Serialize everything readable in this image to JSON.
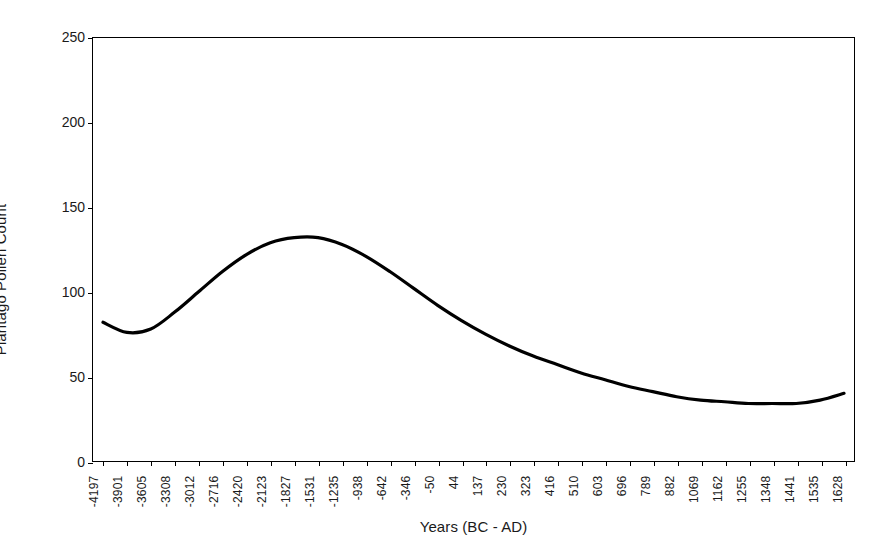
{
  "chart_data": {
    "type": "line",
    "title": "",
    "xlabel": "Years (BC - AD)",
    "ylabel": "Plantago Pollen Count",
    "ylim": [
      0,
      250
    ],
    "ytick_labels": [
      "0",
      "50",
      "100",
      "150",
      "200",
      "250"
    ],
    "ytick_values": [
      0,
      50,
      100,
      150,
      200,
      250
    ],
    "grid": false,
    "legend": "none",
    "line_color": "#000000",
    "categories": [
      "-4197",
      "-3901",
      "-3605",
      "-3308",
      "-3012",
      "-2716",
      "-2420",
      "-2123",
      "-1827",
      "-1531",
      "-1235",
      "-938",
      "-642",
      "-346",
      "-50",
      "44",
      "137",
      "230",
      "323",
      "416",
      "510",
      "603",
      "696",
      "789",
      "882",
      "1069",
      "1162",
      "1255",
      "1348",
      "1441",
      "1535",
      "1628"
    ],
    "series": [
      {
        "name": "Plantago Pollen Count",
        "values": [
          82,
          76,
          78,
          88,
          100,
          112,
          122,
          129,
          132,
          132,
          128,
          121,
          112,
          102,
          92,
          83,
          75,
          68,
          62,
          57,
          52,
          48,
          44,
          41,
          38,
          36,
          35,
          34,
          34,
          34,
          36,
          40
        ]
      }
    ]
  }
}
